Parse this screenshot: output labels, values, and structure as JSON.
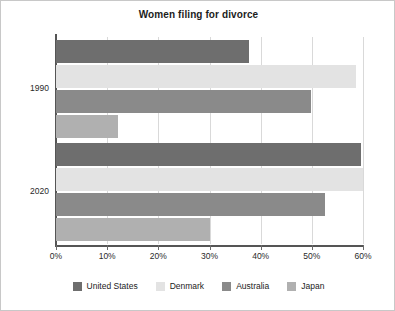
{
  "chart_data": {
    "type": "bar",
    "orientation": "horizontal",
    "title": "Women filing for divorce",
    "xlabel": "",
    "ylabel": "",
    "categories": [
      "1990",
      "2020"
    ],
    "series": [
      {
        "name": "United States",
        "color": "#6e6e6e",
        "values": [
          37.7,
          59.6
        ]
      },
      {
        "name": "Denmark",
        "color": "#e3e3e3",
        "values": [
          58.6,
          60.0
        ]
      },
      {
        "name": "Australia",
        "color": "#8a8a8a",
        "values": [
          49.8,
          52.5
        ]
      },
      {
        "name": "Japan",
        "color": "#b0b0b0",
        "values": [
          12.1,
          30.0
        ]
      }
    ],
    "xlim": [
      0,
      60
    ],
    "xticks": [
      0,
      10,
      20,
      30,
      40,
      50,
      60
    ],
    "xtick_labels": [
      "0%",
      "10%",
      "20%",
      "30%",
      "40%",
      "50%",
      "60%"
    ],
    "grid": true,
    "legend_position": "bottom"
  },
  "legend": {
    "items": [
      {
        "label": "United States",
        "color": "#6e6e6e"
      },
      {
        "label": "Denmark",
        "color": "#e3e3e3"
      },
      {
        "label": "Australia",
        "color": "#8a8a8a"
      },
      {
        "label": "Japan",
        "color": "#b0b0b0"
      }
    ]
  }
}
